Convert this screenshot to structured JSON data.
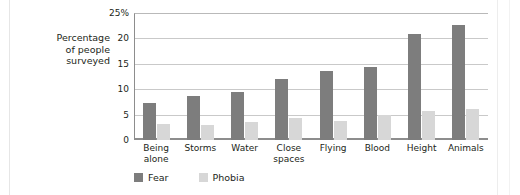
{
  "axis_title_lines": [
    "Percentage",
    "of people",
    "surveyed"
  ],
  "legend": {
    "fear_label": "Fear",
    "phobia_label": "Phobia"
  },
  "colors": {
    "fear": "#7d7d7d",
    "phobia": "#d7d7d7",
    "gridline": "#c9c9c9",
    "axis": "#8d8d8d",
    "text": "#231f20",
    "background": "#ffffff"
  },
  "chart_data": {
    "type": "bar",
    "title": "",
    "xlabel": "",
    "ylabel": "Percentage of people surveyed",
    "ylim": [
      0,
      25
    ],
    "ytick_labels": [
      "25%",
      "20",
      "15",
      "10",
      "5",
      "0"
    ],
    "ytick_values": [
      25,
      20,
      15,
      10,
      5,
      0
    ],
    "grid": true,
    "legend_position": "bottom-left",
    "categories": [
      [
        "Being",
        "alone"
      ],
      [
        "Storms"
      ],
      [
        "Water"
      ],
      [
        "Close",
        "spaces"
      ],
      [
        "Flying"
      ],
      [
        "Blood"
      ],
      [
        "Height"
      ],
      [
        "Animals"
      ]
    ],
    "category_labels": [
      "Being alone",
      "Storms",
      "Water",
      "Close spaces",
      "Flying",
      "Blood",
      "Height",
      "Animals"
    ],
    "series": [
      {
        "name": "Fear",
        "color": "#7d7d7d",
        "values": [
          7.3,
          8.7,
          9.5,
          12.0,
          13.5,
          14.4,
          20.8,
          22.6
        ]
      },
      {
        "name": "Phobia",
        "color": "#d7d7d7",
        "values": [
          3.1,
          2.9,
          3.5,
          4.4,
          3.8,
          4.9,
          5.7,
          6.2
        ]
      }
    ]
  }
}
